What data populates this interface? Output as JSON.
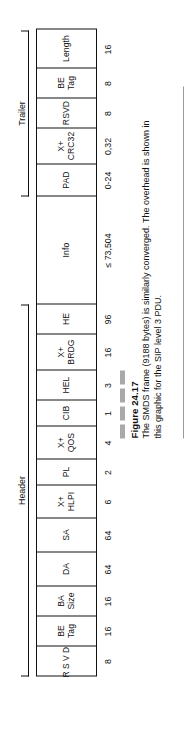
{
  "figure": {
    "number": "Figure 24.17",
    "caption": "The SMDS frame (9188 bytes) is similarly converged. The overhead is shown in this graphic for the SIP level 3 PDU."
  },
  "brackets": [
    {
      "label": "Header"
    },
    {
      "label": "Trailer"
    }
  ],
  "frame": {
    "fields": [
      {
        "label": "RSVD",
        "size": "8"
      },
      {
        "label": "BE\nTag",
        "size": "16"
      },
      {
        "label": "BA\nSize",
        "size": "16"
      },
      {
        "label": "DA",
        "size": "64"
      },
      {
        "label": "SA",
        "size": "64"
      },
      {
        "label": "X+\nHLPI",
        "size": "6"
      },
      {
        "label": "PL",
        "size": "2"
      },
      {
        "label": "X+\nQOS",
        "size": "4"
      },
      {
        "label": "CIB",
        "size": "1"
      },
      {
        "label": "HEL",
        "size": "3"
      },
      {
        "label": "X+\nBRDG",
        "size": "16"
      },
      {
        "label": "HE",
        "size": "96"
      },
      {
        "label": "Info",
        "size": "≤ 73,504"
      },
      {
        "label": "PAD",
        "size": "0-24"
      },
      {
        "label": "X+\nCRC32",
        "size": "0,32"
      },
      {
        "label": "RSVD",
        "size": "8"
      },
      {
        "label": "BE\nTag",
        "size": "8"
      },
      {
        "label": "Length",
        "size": "16"
      }
    ]
  }
}
